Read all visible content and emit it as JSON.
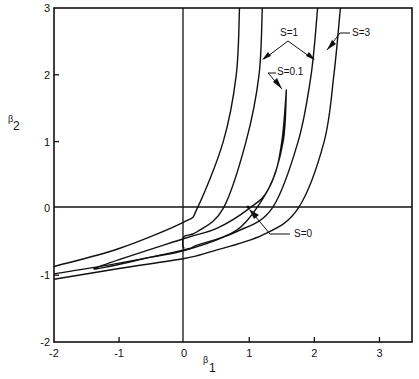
{
  "chart_data": {
    "type": "line",
    "title": "",
    "xlabel": "β1",
    "ylabel": "β2",
    "xlim": [
      -2,
      3.5
    ],
    "ylim": [
      -2,
      3
    ],
    "xticks": [
      -2,
      -1,
      0,
      1,
      2,
      3
    ],
    "yticks": [
      -2,
      -1,
      0,
      1,
      2,
      3
    ],
    "grid": false,
    "reference_lines": [
      {
        "axis": "x",
        "value": 0
      },
      {
        "axis": "y",
        "value": 0
      }
    ],
    "annotations": [
      {
        "text": "S=3",
        "x": 2.55,
        "y": 2.7
      },
      {
        "text": "S=1",
        "x": 1.25,
        "y": 2.7
      },
      {
        "text": "S=0.1",
        "x": 1.35,
        "y": 2.1
      },
      {
        "text": "S=0",
        "x": 1.7,
        "y": -0.35
      }
    ],
    "series": [
      {
        "name": "S=3 (upper branch)",
        "points": [
          [
            2.4,
            3.0
          ],
          [
            2.3,
            2.0
          ],
          [
            2.15,
            1.0
          ],
          [
            1.75,
            0.0
          ],
          [
            1.2,
            -0.4
          ],
          [
            0.4,
            -0.65
          ],
          [
            0,
            -0.75
          ],
          [
            -1,
            -0.9
          ],
          [
            -2,
            -1.06
          ]
        ]
      },
      {
        "name": "S=1 (right branch)",
        "points": [
          [
            2.05,
            3.0
          ],
          [
            1.95,
            2.0
          ],
          [
            1.75,
            1.0
          ],
          [
            1.35,
            0.0
          ],
          [
            0.8,
            -0.35
          ],
          [
            0.2,
            -0.55
          ],
          [
            0,
            -0.62
          ],
          [
            -1,
            -0.82
          ],
          [
            -2,
            -0.98
          ]
        ]
      },
      {
        "name": "S=0.1 (closed contour)",
        "points": [
          [
            1.57,
            1.78
          ],
          [
            1.52,
            1.0
          ],
          [
            1.3,
            0.3
          ],
          [
            1.0,
            0.0
          ],
          [
            0.5,
            -0.3
          ],
          [
            0,
            -0.45
          ],
          [
            -1.38,
            -0.9
          ],
          [
            -0.5,
            -0.73
          ],
          [
            0,
            -0.63
          ],
          [
            0.6,
            -0.43
          ],
          [
            0.95,
            -0.2
          ],
          [
            1.35,
            0.4
          ],
          [
            1.5,
            1.0
          ],
          [
            1.57,
            1.78
          ]
        ]
      },
      {
        "name": "S=1 (left branch)",
        "points": [
          [
            1.2,
            3.0
          ],
          [
            1.15,
            2.0
          ],
          [
            0.95,
            1.0
          ],
          [
            0.6,
            0.0
          ],
          [
            0.2,
            -0.35
          ],
          [
            0,
            -0.42
          ],
          [
            -0.02,
            -0.55
          ],
          [
            0,
            -0.6
          ]
        ]
      },
      {
        "name": "S=3 (left branch)",
        "points": [
          [
            0.85,
            3.0
          ],
          [
            0.8,
            2.0
          ],
          [
            0.6,
            1.0
          ],
          [
            0.2,
            0.0
          ],
          [
            0,
            -0.2
          ],
          [
            -1,
            -0.6
          ],
          [
            -2,
            -0.87
          ]
        ]
      }
    ],
    "s0_point": [
      1.0,
      0.0
    ]
  }
}
